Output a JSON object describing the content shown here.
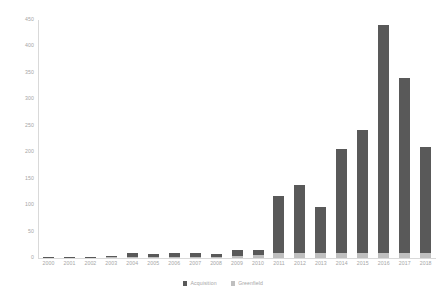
{
  "chart_data": {
    "type": "bar",
    "title": "",
    "subtitle": "",
    "xlabel": "",
    "ylabel": "",
    "stacked": true,
    "grid": false,
    "legend_position": "bottom",
    "ylim": [
      0,
      450
    ],
    "ytick_labels": [
      "450",
      "400",
      "350",
      "300",
      "250",
      "200",
      "150",
      "100",
      "50",
      "0"
    ],
    "ytick_values": [
      450,
      400,
      350,
      300,
      250,
      200,
      150,
      100,
      50,
      0
    ],
    "categories": [
      "2000",
      "2001",
      "2002",
      "2003",
      "2004",
      "2005",
      "2006",
      "2007",
      "2008",
      "2009",
      "2010",
      "2011",
      "2012",
      "2013",
      "2014",
      "2015",
      "2016",
      "2017",
      "2018"
    ],
    "series": [
      {
        "name": "Acquisition",
        "color": "#595959",
        "values": [
          1,
          1,
          1,
          2,
          8,
          5,
          7,
          8,
          6,
          11,
          10,
          108,
          130,
          88,
          196,
          233,
          430,
          330,
          200
        ]
      },
      {
        "name": "Greenfield",
        "color": "#bfbfbf",
        "values": [
          0,
          0,
          0,
          1,
          2,
          2,
          2,
          2,
          2,
          4,
          5,
          9,
          9,
          9,
          10,
          10,
          10,
          10,
          9
        ]
      }
    ],
    "totals": [
      1,
      1,
      1,
      3,
      10,
      7,
      9,
      10,
      8,
      15,
      15,
      117,
      139,
      97,
      206,
      243,
      440,
      340,
      209
    ]
  },
  "legend": {
    "items": [
      {
        "label": "Acquisition",
        "color": "#595959"
      },
      {
        "label": "Greenfield",
        "color": "#bfbfbf"
      }
    ]
  },
  "colors": {
    "acquisition": "#595959",
    "greenfield": "#bfbfbf",
    "axis": "#d9d9d9",
    "tick_text": "#a6a6a6",
    "background": "#ffffff"
  }
}
